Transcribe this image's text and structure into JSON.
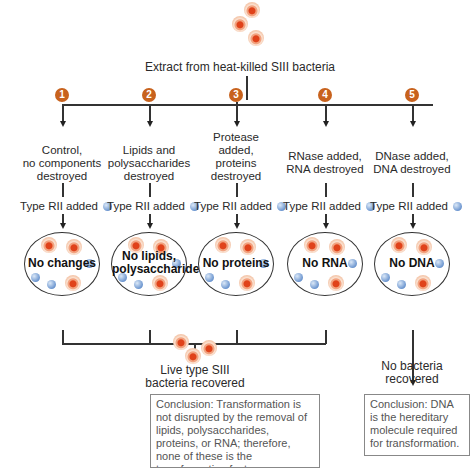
{
  "title": "Extract from heat-killed SIII bacteria",
  "colors": {
    "badge": "#c8621d",
    "cell_nucleus": "#e0421a",
    "rii_cell": "#6b95cf",
    "line": "#333333"
  },
  "steps": [
    {
      "number": "1",
      "treatment": "Control,\nno components\ndestroyed",
      "added": "Type RII added",
      "result": "No changes"
    },
    {
      "number": "2",
      "treatment": "Lipids and\npolysaccharides\ndestroyed",
      "added": "Type RII added",
      "result": "No lipids,\npolysaccharides"
    },
    {
      "number": "3",
      "treatment": "Protease\nadded,\nproteins\ndestroyed",
      "added": "Type RII added",
      "result": "No proteins"
    },
    {
      "number": "4",
      "treatment": "RNase added,\nRNA destroyed",
      "added": "Type RII added",
      "result": "No RNA"
    },
    {
      "number": "5",
      "treatment": "DNase added,\nDNA destroyed",
      "added": "Type RII added",
      "result": "No DNA"
    }
  ],
  "outcomes": {
    "left": "Live type SIII\nbacteria recovered",
    "right": "No bacteria\nrecovered"
  },
  "conclusions": {
    "left": "Conclusion: Transformation is not disrupted by the removal of lipids, polysaccharides, proteins, or RNA; therefore, none of these is the transformation factor.",
    "right": "Conclusion: DNA is the hereditary molecule required for transformation."
  },
  "icons": {
    "siii_cell": "siii-cell-icon",
    "rii_cell": "rii-cell-icon"
  }
}
